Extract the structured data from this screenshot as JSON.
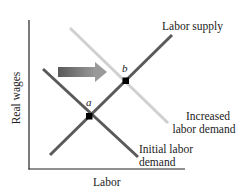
{
  "diagram": {
    "type": "supply-demand",
    "axes": {
      "x_label": "Labor",
      "y_label": "Real wages"
    },
    "curves": [
      {
        "name": "Labor supply",
        "label": "Labor supply",
        "color": "#5a5a5a"
      },
      {
        "name": "Initial labor demand",
        "label_line1": "Initial labor",
        "label_line2": "demand",
        "color": "#5a5a5a"
      },
      {
        "name": "Increased labor demand",
        "label_line1": "Increased",
        "label_line2": "labor demand",
        "color": "#d0d0d0"
      }
    ],
    "points": [
      {
        "label": "a",
        "description": "initial equilibrium"
      },
      {
        "label": "b",
        "description": "new equilibrium"
      }
    ],
    "arrow": {
      "direction": "right",
      "meaning": "demand shift"
    },
    "colors": {
      "axis": "#222222",
      "curve_dark": "#5a5a5a",
      "curve_light": "#d0d0d0",
      "arrow": "#777777"
    }
  }
}
